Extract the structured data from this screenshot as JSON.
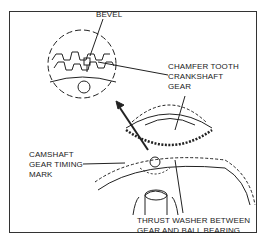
{
  "diagram": {
    "labels": {
      "bevel": "BEVEL",
      "chamfer_line1": "CHAMFER TOOTH",
      "chamfer_line2": "CRANKSHAFT",
      "chamfer_line3": "GEAR",
      "camshaft_line1": "CAMSHAFT",
      "camshaft_line2": "GEAR TIMING",
      "camshaft_line3": "MARK",
      "thrust_line1": "THRUST WASHER BETWEEN",
      "thrust_line2": "GEAR AND BALL BEARING"
    },
    "colors": {
      "line": "#222222",
      "background": "#ffffff"
    }
  }
}
